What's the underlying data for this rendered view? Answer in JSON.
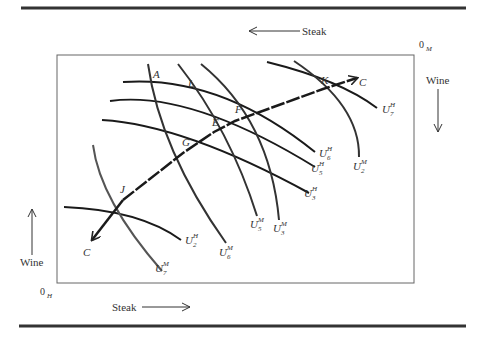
{
  "diagram": {
    "type": "edgeworth-box",
    "origins": {
      "household": {
        "label": "0",
        "sub": "H"
      },
      "merchant": {
        "label": "0",
        "sub": "M"
      }
    },
    "axes": {
      "top_steak": "Steak",
      "bottom_steak": "Steak",
      "left_wine": "Wine",
      "right_wine": "Wine"
    },
    "points": {
      "A": "A",
      "L": "L",
      "F": "F",
      "E": "E",
      "G": "G",
      "J": "J",
      "K": "K"
    },
    "contract_curve": {
      "start_label": "C",
      "end_label": "C"
    },
    "household_curves": [
      {
        "base": "U",
        "sup": "H",
        "sub": "7"
      },
      {
        "base": "U",
        "sup": "H",
        "sub": "6"
      },
      {
        "base": "U",
        "sup": "H",
        "sub": "5"
      },
      {
        "base": "U",
        "sup": "H",
        "sub": "3"
      },
      {
        "base": "U",
        "sup": "H",
        "sub": "2"
      }
    ],
    "merchant_curves": [
      {
        "base": "U",
        "sup": "M",
        "sub": "2"
      },
      {
        "base": "U",
        "sup": "M",
        "sub": "5"
      },
      {
        "base": "U",
        "sup": "M",
        "sub": "3"
      },
      {
        "base": "U",
        "sup": "M",
        "sub": "6"
      },
      {
        "base": "U",
        "sup": "M",
        "sub": "7"
      }
    ],
    "colors": {
      "curve": "#1a1a1a",
      "merchant_curve": "#444444",
      "box": "#555555",
      "rule": "#333333",
      "text": "#333333"
    }
  }
}
